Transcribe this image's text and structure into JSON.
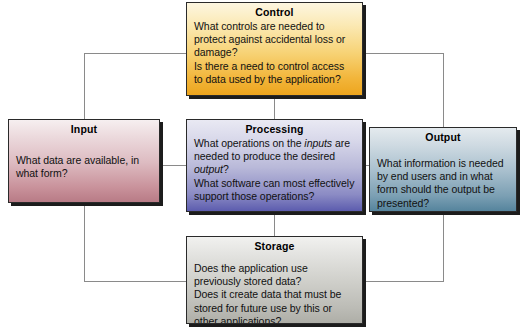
{
  "diagram": {
    "accent_colors": {
      "control": "#eda51e",
      "input": "#b87b86",
      "processing": "#5c5cae",
      "output": "#55849d",
      "storage": "#aeaea7",
      "connector_line": "#8a8a8a",
      "box_border": "#2a2a2a",
      "text": "#111111"
    },
    "boxes": {
      "control": {
        "title": "Control",
        "lines": [
          "What controls are needed to protect against accidental loss or damage?",
          "Is there a need to control access to data used by the application?"
        ]
      },
      "input": {
        "title": "Input",
        "lines": [
          "What data are available, in what form?"
        ]
      },
      "processing": {
        "title": "Processing",
        "lines_html": [
          "What operations on the <em>inputs</em> are needed to produce the desired <em>output</em>?",
          "What software can most effectively support those operations?"
        ]
      },
      "output": {
        "title": "Output",
        "lines": [
          "What information is needed by end users and in what form should the output be presented?"
        ]
      },
      "storage": {
        "title": "Storage",
        "lines": [
          "Does the application use previously stored data?",
          "Does it create data that must be stored for future use by this or other applications?"
        ]
      }
    }
  }
}
